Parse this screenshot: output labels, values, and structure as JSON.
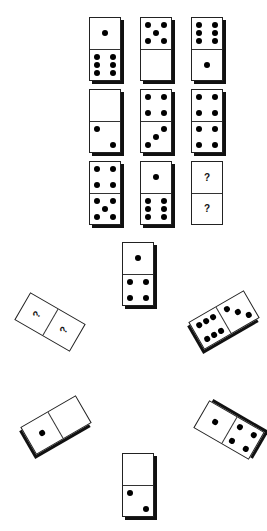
{
  "puzzle": {
    "type": "domino-matrix-puzzle",
    "grid": [
      [
        {
          "top": 1,
          "bottom": 6
        },
        {
          "top": 5,
          "bottom": 0
        },
        {
          "top": 6,
          "bottom": 1
        }
      ],
      [
        {
          "top": 0,
          "bottom": 2
        },
        {
          "top": 4,
          "bottom": 3
        },
        {
          "top": 4,
          "bottom": 4
        }
      ],
      [
        {
          "top": 4,
          "bottom": 5
        },
        {
          "top": 1,
          "bottom": 6
        },
        {
          "top": "?",
          "bottom": "?"
        }
      ]
    ],
    "question_mark": "?",
    "options": [
      {
        "position": "top",
        "a": 1,
        "b": 4,
        "rotation": 0
      },
      {
        "position": "left",
        "a": "?",
        "b": "?",
        "rotation": 30
      },
      {
        "position": "right",
        "a": 3,
        "b": 6,
        "rotation": -30
      },
      {
        "position": "bottom-left",
        "a": 0,
        "b": 1,
        "rotation": -30
      },
      {
        "position": "bottom-right",
        "a": 1,
        "b": 4,
        "rotation": 30
      },
      {
        "position": "bottom",
        "a": 0,
        "b": 2,
        "rotation": 0
      }
    ]
  },
  "colors": {
    "pip": "#000000",
    "border": "#222222",
    "shadow": "#111111",
    "background": "#ffffff"
  }
}
